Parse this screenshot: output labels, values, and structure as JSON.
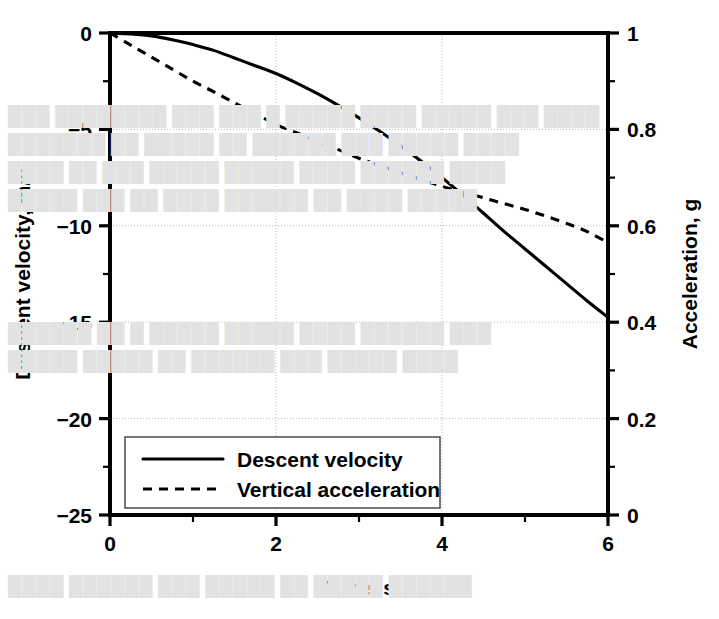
{
  "chart_data": {
    "type": "line",
    "title": "",
    "xlabel": "Time, s",
    "ylabel": "Descent velocity, m/s",
    "y2label": "Acceleration, g",
    "xlim": [
      0,
      6
    ],
    "ylim": [
      -25,
      0
    ],
    "y2lim": [
      0,
      1
    ],
    "grid": true,
    "legend_position": "bottom-left-inside",
    "x_ticks": [
      0,
      2,
      4,
      6
    ],
    "x_tick_labels": [
      "0",
      "2",
      "4",
      "6"
    ],
    "x_minor_ticks": [
      1,
      3,
      5
    ],
    "y_ticks": [
      0,
      -5,
      -10,
      -15,
      -20,
      -25
    ],
    "y_tick_labels": [
      "0",
      "−5",
      "−10",
      "−15",
      "−20",
      "−25"
    ],
    "y_minor_ticks": [
      -2.5,
      -7.5,
      -12.5,
      -17.5,
      -22.5
    ],
    "y2_ticks": [
      1,
      0.8,
      0.6,
      0.4,
      0.2,
      0
    ],
    "y2_tick_labels": [
      "1",
      "0.8",
      "0.6",
      "0.4",
      "0.2",
      "0"
    ],
    "y2_minor_ticks": [
      0.9,
      0.7,
      0.5,
      0.3,
      0.1
    ],
    "series": [
      {
        "name": "Descent velocity",
        "axis": "left",
        "style": "solid",
        "units": "m/s",
        "x": [
          0,
          0.25,
          0.5,
          0.75,
          1.0,
          1.25,
          1.5,
          1.75,
          2.0,
          2.25,
          2.5,
          2.75,
          3.0,
          3.25,
          3.5,
          3.75,
          4.0,
          4.25,
          4.5,
          4.75,
          5.0,
          5.25,
          5.5,
          5.75,
          6.0
        ],
        "values": [
          0,
          -0.05,
          -0.15,
          -0.35,
          -0.6,
          -0.9,
          -1.3,
          -1.7,
          -2.1,
          -2.6,
          -3.15,
          -3.75,
          -4.4,
          -5.1,
          -5.85,
          -6.65,
          -7.5,
          -8.4,
          -9.35,
          -10.3,
          -11.2,
          -12.1,
          -13.0,
          -13.9,
          -14.75
        ]
      },
      {
        "name": "Vertical acceleration",
        "axis": "right",
        "style": "dashed",
        "units": "g",
        "x": [
          0,
          0.25,
          0.5,
          0.75,
          1.0,
          1.25,
          1.5,
          1.75,
          2.0,
          2.25,
          2.5,
          2.75,
          3.0,
          3.25,
          3.5,
          3.75,
          4.0,
          4.25,
          4.5,
          4.75,
          5.0,
          5.25,
          5.5,
          5.75,
          6.0
        ],
        "values": [
          1.0,
          0.975,
          0.95,
          0.925,
          0.9,
          0.878,
          0.855,
          0.833,
          0.81,
          0.793,
          0.775,
          0.758,
          0.74,
          0.725,
          0.71,
          0.696,
          0.682,
          0.67,
          0.658,
          0.646,
          0.634,
          0.62,
          0.605,
          0.588,
          0.565
        ]
      }
    ],
    "legend": [
      {
        "label": "Descent velocity",
        "style": "solid"
      },
      {
        "label": "Vertical acceleration",
        "style": "dashed"
      }
    ],
    "annotations": []
  },
  "background_text": {
    "lines": [
      {
        "text": "███ ████████ ███ ███ █ █████ ████ █████ ███ ████",
        "x": 8,
        "y": 105
      },
      {
        "text": "███████ ██ █████ ██ ██████ ███ █████ ████",
        "x": 8,
        "y": 133
      },
      {
        "text": "████ ██ ███ █████ █████ ████ ██████ ████",
        "x": 8,
        "y": 161
      },
      {
        "text": "█████ ███ ██ ████ ██████ ██ ████ █████",
        "x": 8,
        "y": 189
      },
      {
        "text": "██████ ██ █ █████ █████ ████ ██████ ███",
        "x": 8,
        "y": 322
      },
      {
        "text": "█████ █████ ██ ██████ ███ █████ ████",
        "x": 8,
        "y": 350
      },
      {
        "text": "████ ██████ ███ █████ ██ █████ ██████",
        "x": 8,
        "y": 575
      }
    ]
  },
  "colors": {
    "foreground": "#000000",
    "background": "#ffffff",
    "grid": "#b9b9b9",
    "legend_border": "#555555"
  }
}
